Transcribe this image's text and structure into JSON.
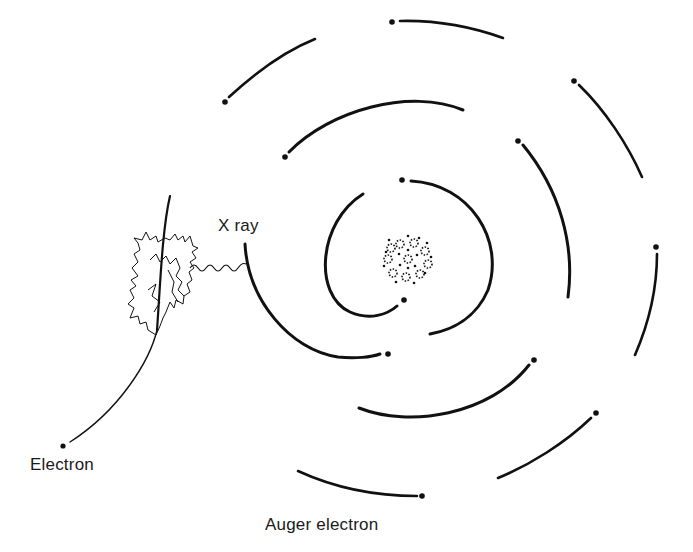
{
  "diagram": {
    "type": "atomic-model",
    "labels": {
      "x_ray": "X ray",
      "electron": "Electron",
      "auger": "Auger electron"
    },
    "nucleus": {
      "cx": 408,
      "cy": 259,
      "r": 25
    },
    "colors": {
      "ink": "#111111",
      "background": "#ffffff"
    }
  }
}
